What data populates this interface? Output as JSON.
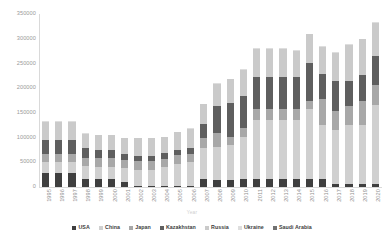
{
  "chart_data": {
    "type": "bar",
    "stacked": true,
    "title": "",
    "xlabel": "Year",
    "ylabel": "",
    "ylim": [
      0,
      350000
    ],
    "ytick_step": 50000,
    "ytick_labels": [
      "350000",
      "300000",
      "250000",
      "200000",
      "150000",
      "100000",
      "50000",
      "0"
    ],
    "grid": false,
    "legend_position": "bottom",
    "categories": [
      "1995",
      "1996",
      "1997",
      "1998",
      "1999",
      "2000",
      "2001",
      "2002",
      "2003",
      "2004",
      "2005",
      "2006",
      "2007",
      "2008",
      "2009",
      "2010",
      "2011",
      "2012",
      "2013",
      "2014",
      "2015",
      "2016",
      "2017",
      "2018",
      "2019",
      "2020"
    ],
    "series": [
      {
        "name": "USA",
        "color": "#3f3f3f",
        "values": [
          28000,
          28000,
          28000,
          17000,
          16000,
          16000,
          10000,
          2000,
          2000,
          2000,
          2000,
          2000,
          16000,
          15000,
          15000,
          16000,
          16000,
          16000,
          16000,
          16000,
          16000,
          16000,
          6000,
          6000,
          6000,
          6000
        ]
      },
      {
        "name": "China",
        "color": "#d0d0d0",
        "values": [
          22000,
          22000,
          22000,
          25000,
          25000,
          25000,
          28000,
          33000,
          33000,
          38000,
          45000,
          48000,
          62000,
          66000,
          71000,
          86000,
          119000,
          119000,
          119000,
          119000,
          142000,
          110000,
          109000,
          119000,
          119000,
          160000
        ]
      },
      {
        "name": "Japan",
        "color": "#a8a8a8",
        "values": [
          17000,
          17000,
          17000,
          17000,
          17000,
          17000,
          17000,
          17000,
          17000,
          17000,
          17000,
          17000,
          22000,
          28000,
          16000,
          17000,
          22000,
          22000,
          22000,
          22000,
          16000,
          52000,
          39000,
          39000,
          50000,
          40000
        ]
      },
      {
        "name": "Kazakhstan",
        "color": "#5f5f5f",
        "values": [
          29000,
          29000,
          29000,
          20000,
          16000,
          16000,
          11000,
          11000,
          11000,
          11000,
          11000,
          11000,
          28000,
          55000,
          67000,
          65000,
          65000,
          65000,
          65000,
          65000,
          77000,
          50000,
          60000,
          50000,
          52000,
          60000
        ]
      },
      {
        "name": "Russia",
        "color": "#cacaca",
        "values": [
          36000,
          36000,
          36000,
          29000,
          31000,
          31000,
          33000,
          36000,
          36000,
          33000,
          36000,
          40000,
          40000,
          45000,
          49000,
          53000,
          58000,
          58000,
          58000,
          54000,
          58000,
          56000,
          58000,
          74000,
          72000,
          66000
        ]
      },
      {
        "name": "Ukraine",
        "color": "#dedede",
        "values": [
          1000,
          1000,
          1000,
          1000,
          1000,
          1000,
          1000,
          1000,
          1000,
          1000,
          1000,
          1000,
          1000,
          1000,
          1000,
          1000,
          1000,
          1000,
          1000,
          1000,
          1000,
          1000,
          1000,
          1000,
          1000,
          1000
        ]
      },
      {
        "name": "Saudi Arabia",
        "color": "#717171",
        "values": [
          0,
          0,
          0,
          0,
          0,
          0,
          0,
          0,
          0,
          0,
          0,
          0,
          0,
          0,
          0,
          0,
          0,
          0,
          0,
          0,
          0,
          0,
          0,
          0,
          0,
          0
        ]
      }
    ],
    "totals": [
      133000,
      133000,
      133000,
      109000,
      106000,
      106000,
      100000,
      100000,
      100000,
      102000,
      112000,
      119000,
      169000,
      210000,
      219000,
      238000,
      281000,
      281000,
      281000,
      277000,
      310000,
      285000,
      273000,
      289000,
      300000,
      333000
    ]
  }
}
